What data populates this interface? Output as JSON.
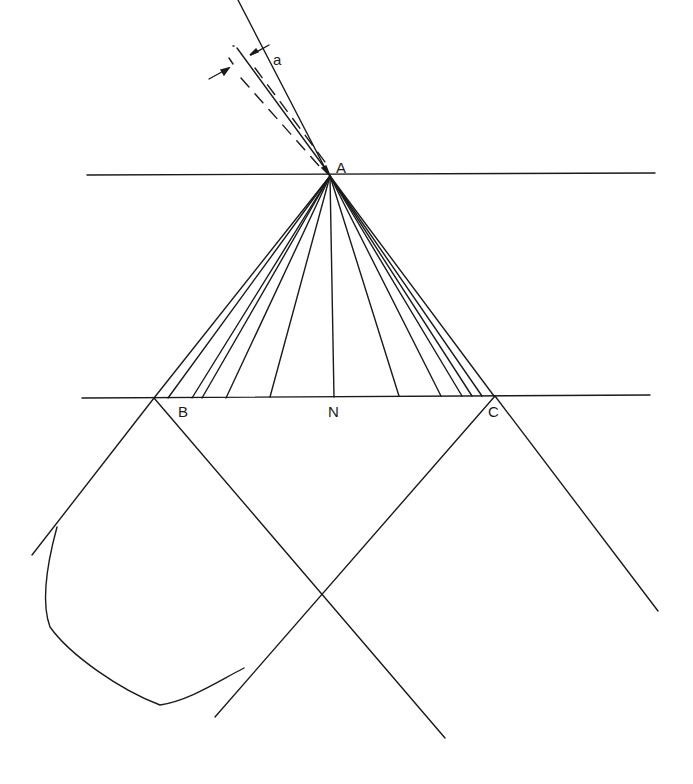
{
  "diagram": {
    "labels": {
      "a": "a",
      "A": "A",
      "B": "B",
      "N": "N",
      "C": "C"
    },
    "ink_color": "#1a1a1a",
    "apex": {
      "x": 330,
      "y": 176
    },
    "top_line": {
      "x1": 87,
      "x2": 655,
      "y": 175
    },
    "bottom_line": {
      "x1": 82,
      "x2": 650,
      "y": 397
    },
    "fan_endpoints_x": [
      154,
      168,
      192,
      202,
      226,
      270,
      334,
      399,
      441,
      462,
      472,
      482,
      494
    ]
  }
}
